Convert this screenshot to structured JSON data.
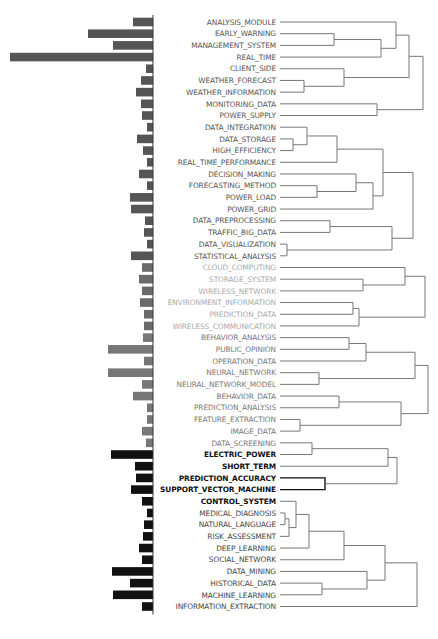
{
  "figure": {
    "type": "dendrogram-with-bars",
    "row_spacing": 11.69,
    "first_row_y": 22,
    "bar_axis_x": 153,
    "label_right_x": 276,
    "line_start_x": 280,
    "groups": [
      {
        "name": "group-1",
        "color": "#555555",
        "bar_color": "#555555",
        "rows": [
          0,
          20
        ]
      },
      {
        "name": "group-2",
        "color": "#aaaaaa",
        "bar_color": "#6a6a6a",
        "rows": [
          21,
          26
        ]
      },
      {
        "name": "group-3",
        "color": "#777777",
        "bar_color": "#777777",
        "rows": [
          27,
          36
        ]
      },
      {
        "name": "group-4",
        "color": "#111111",
        "bar_color": "#111111",
        "rows": [
          37,
          41
        ],
        "bold": true
      },
      {
        "name": "group-5",
        "color": "#444444",
        "bar_color": "#111111",
        "rows": [
          42,
          51
        ]
      }
    ]
  },
  "chart_data": {
    "type": "dendrogram",
    "title": "",
    "leaves": [
      {
        "label": "ANALYSIS_MODULE",
        "bar": 20
      },
      {
        "label": "EARLY_WARNING",
        "bar": 65
      },
      {
        "label": "MANAGEMENT_SYSTEM",
        "bar": 40
      },
      {
        "label": "REAL_TIME",
        "bar": 143
      },
      {
        "label": "CLIENT_SIDE",
        "bar": 7
      },
      {
        "label": "WEATHER_FORECAST",
        "bar": 12
      },
      {
        "label": "WEATHER_INFORMATION",
        "bar": 17
      },
      {
        "label": "MONITORING_DATA",
        "bar": 12
      },
      {
        "label": "POWER_SUPPLY",
        "bar": 11
      },
      {
        "label": "DATA_INTEGRATION",
        "bar": 6
      },
      {
        "label": "DATA_STORAGE",
        "bar": 16
      },
      {
        "label": "HIGH_EFFICIENCY",
        "bar": 10
      },
      {
        "label": "REAL_TIME_PERFORMANCE",
        "bar": 6
      },
      {
        "label": "DECISION_MAKING",
        "bar": 14
      },
      {
        "label": "FORECASTING_METHOD",
        "bar": 6
      },
      {
        "label": "POWER_LOAD",
        "bar": 23
      },
      {
        "label": "POWER_GRID",
        "bar": 22
      },
      {
        "label": "DATA_PREPROCESSING",
        "bar": 8
      },
      {
        "label": "TRAFFIC_BIG_DATA",
        "bar": 9
      },
      {
        "label": "DATA_VISUALIZATION",
        "bar": 6
      },
      {
        "label": "STATISTICAL_ANALYSIS",
        "bar": 22
      },
      {
        "label": "CLOUD_COMPUTING",
        "bar": 11
      },
      {
        "label": "STORAGE_SYSTEM",
        "bar": 14
      },
      {
        "label": "WIRELESS_NETWORK",
        "bar": 11
      },
      {
        "label": "ENVIRONMENT_INFORMATION",
        "bar": 13
      },
      {
        "label": "PREDICTION_DATA",
        "bar": 9
      },
      {
        "label": "WIRELESS_COMMUNICATION",
        "bar": 9
      },
      {
        "label": "BEHAVIOR_ANALYSIS",
        "bar": 10
      },
      {
        "label": "PUBLIC_OPINION",
        "bar": 45
      },
      {
        "label": "OPERATION_DATA",
        "bar": 9
      },
      {
        "label": "NEURAL_NETWORK",
        "bar": 45
      },
      {
        "label": "NEURAL_NETWORK_MODEL",
        "bar": 11
      },
      {
        "label": "BEHAVIOR_DATA",
        "bar": 20
      },
      {
        "label": "PREDICTION_ANALYSIS",
        "bar": 6
      },
      {
        "label": "FEATURE_EXTRACTION",
        "bar": 6
      },
      {
        "label": "IMAGE_DATA",
        "bar": 11
      },
      {
        "label": "DATA_SCREENING",
        "bar": 7
      },
      {
        "label": "ELECTRIC_POWER",
        "bar": 42
      },
      {
        "label": "SHORT_TERM",
        "bar": 18
      },
      {
        "label": "PREDICTION_ACCURACY",
        "bar": 17
      },
      {
        "label": "SUPPORT_VECTOR_MACHINE",
        "bar": 22
      },
      {
        "label": "CONTROL_SYSTEM",
        "bar": 11
      },
      {
        "label": "MEDICAL_DIAGNOSIS",
        "bar": 6
      },
      {
        "label": "NATURAL_LANGUAGE",
        "bar": 9
      },
      {
        "label": "RISK_ASSESSMENT",
        "bar": 10
      },
      {
        "label": "DEEP_LEARNING",
        "bar": 14
      },
      {
        "label": "SOCIAL_NETWORK",
        "bar": 11
      },
      {
        "label": "DATA_MINING",
        "bar": 41
      },
      {
        "label": "HISTORICAL_DATA",
        "bar": 23
      },
      {
        "label": "MACHINE_LEARNING",
        "bar": 40
      },
      {
        "label": "INFORMATION_EXTRACTION",
        "bar": 11
      }
    ],
    "merges": [
      {
        "a": 1,
        "b": 2,
        "x": 334
      },
      {
        "a": "m0",
        "b": 3,
        "x": 381
      },
      {
        "a": 0,
        "b": "m1",
        "x": 396
      },
      {
        "a": 5,
        "b": 6,
        "x": 304
      },
      {
        "a": 4,
        "b": "m3",
        "x": 344
      },
      {
        "a": "m2",
        "b": "m4",
        "x": 409
      },
      {
        "a": 7,
        "b": 8,
        "x": 377
      },
      {
        "a": "m5",
        "b": "m6",
        "x": 423
      },
      {
        "a": 10,
        "b": 11,
        "x": 293
      },
      {
        "a": 9,
        "b": "m8",
        "x": 307
      },
      {
        "a": "m9",
        "b": 12,
        "x": 337
      },
      {
        "a": 14,
        "b": 15,
        "x": 317
      },
      {
        "a": 13,
        "b": "m11",
        "x": 356
      },
      {
        "a": "m12",
        "b": 16,
        "x": 373
      },
      {
        "a": "m10",
        "b": "m13",
        "x": 383
      },
      {
        "a": 17,
        "b": 18,
        "x": 330
      },
      {
        "a": 19,
        "b": 20,
        "x": 287
      },
      {
        "a": "m15",
        "b": "m16",
        "x": 392
      },
      {
        "a": "m14",
        "b": "m17",
        "x": 413
      },
      {
        "a": 22,
        "b": 23,
        "x": 363
      },
      {
        "a": 21,
        "b": "m19",
        "x": 405
      },
      {
        "a": 24,
        "b": 25,
        "x": 353
      },
      {
        "a": "m21",
        "b": 26,
        "x": 359
      },
      {
        "a": "m20",
        "b": "m22",
        "x": 425
      },
      {
        "a": 27,
        "b": 28,
        "x": 349
      },
      {
        "a": "m24",
        "b": 29,
        "x": 366
      },
      {
        "a": 30,
        "b": 31,
        "x": 319
      },
      {
        "a": "m25",
        "b": "m26",
        "x": 415
      },
      {
        "a": 32,
        "b": 33,
        "x": 339
      },
      {
        "a": 34,
        "b": 35,
        "x": 300
      },
      {
        "a": "m28",
        "b": "m29",
        "x": 401
      },
      {
        "a": "m27",
        "b": "m30",
        "x": 428
      },
      {
        "a": 36,
        "b": 37,
        "x": 312
      },
      {
        "a": "m32",
        "b": 38,
        "x": 388
      },
      {
        "a": 39,
        "b": 40,
        "x": 325
      },
      {
        "a": "m33",
        "b": "m34",
        "x": 397
      },
      {
        "a": 42,
        "b": 43,
        "x": 285
      },
      {
        "a": "m36",
        "b": 44,
        "x": 289
      },
      {
        "a": 41,
        "b": "m37",
        "x": 296
      },
      {
        "a": "m38",
        "b": 45,
        "x": 309
      },
      {
        "a": "m39",
        "b": 46,
        "x": 344
      },
      {
        "a": 48,
        "b": 49,
        "x": 322
      },
      {
        "a": 47,
        "b": "m41",
        "x": 367
      },
      {
        "a": "m40",
        "b": "m42",
        "x": 385
      },
      {
        "a": "m43",
        "b": 50,
        "x": 417
      },
      {
        "a": "m44",
        "b": 51,
        "x": 417
      }
    ]
  }
}
